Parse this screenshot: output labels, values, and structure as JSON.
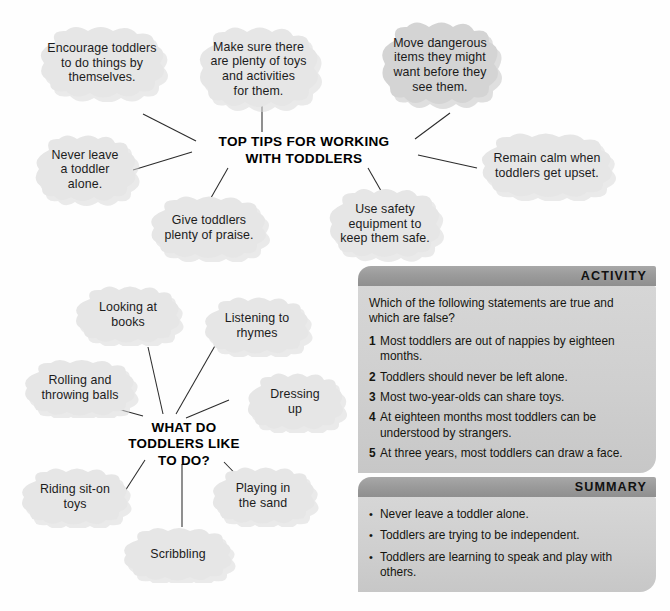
{
  "mindmaps": [
    {
      "id": "top-tips",
      "center": "TOP TIPS FOR WORKING\nWITH TODDLERS",
      "nodes": [
        {
          "label": "Encourage toddlers\nto do things by\nthemselves."
        },
        {
          "label": "Make sure there\nare plenty of toys\nand activities\nfor them."
        },
        {
          "label": "Move dangerous\nitems they might\nwant before they\nsee them."
        },
        {
          "label": "Never leave\na toddler\nalone."
        },
        {
          "label": "Remain calm when\ntoddlers get upset."
        },
        {
          "label": "Give toddlers\nplenty of praise."
        },
        {
          "label": "Use safety\nequipment to\nkeep them safe."
        }
      ]
    },
    {
      "id": "what-toddlers-like",
      "center": "WHAT DO\nTODDLERS LIKE\nTO DO?",
      "nodes": [
        {
          "label": "Looking at\nbooks"
        },
        {
          "label": "Listening to\nrhymes"
        },
        {
          "label": "Rolling and\nthrowing balls"
        },
        {
          "label": "Dressing\nup"
        },
        {
          "label": "Riding sit-on\ntoys"
        },
        {
          "label": "Playing in\nthe sand"
        },
        {
          "label": "Scribbling"
        }
      ]
    }
  ],
  "activity": {
    "title": "ACTIVITY",
    "intro": "Which of the following statements are true and which are false?",
    "items": [
      {
        "num": "1",
        "text": "Most toddlers are out of nappies by eighteen months."
      },
      {
        "num": "2",
        "text": "Toddlers should never be left alone."
      },
      {
        "num": "3",
        "text": "Most two-year-olds can share toys."
      },
      {
        "num": "4",
        "text": "At eighteen months most toddlers can be understood by strangers."
      },
      {
        "num": "5",
        "text": "At three years, most toddlers can draw a face."
      }
    ]
  },
  "summary": {
    "title": "SUMMARY",
    "bullet": "•",
    "items": [
      "Never leave a toddler alone.",
      "Toddlers are trying to be independent.",
      "Toddlers are learning to speak and play with others."
    ]
  },
  "colors": {
    "cloud_light": "#e4e4e4",
    "cloud_dark": "#d2d2d2",
    "panel_header": "#9b9b9b",
    "panel_body": "#cfcfcf",
    "line": "#2b2b2b",
    "text": "#1a1a1a"
  }
}
